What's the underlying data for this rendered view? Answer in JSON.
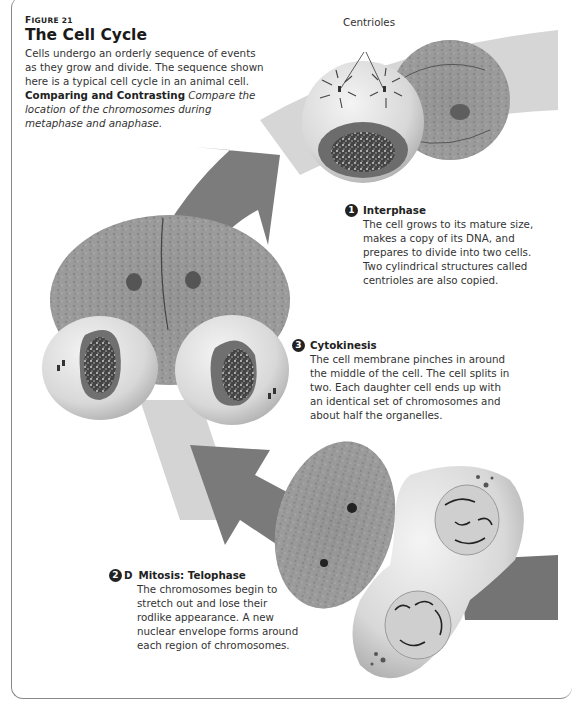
{
  "figure": {
    "number_prefix": "F",
    "number_rest": "IGURE 21",
    "title": "The Cell Cycle",
    "intro": "Cells undergo an orderly sequence of events as they grow and divide. The sequence shown here is a typical cell cycle in an animal cell.",
    "skill_label": "Comparing and Contrasting",
    "skill_prompt": "Compare the location of the chromosomes during metaphase and anaphase."
  },
  "labels": {
    "centrioles": "Centrioles"
  },
  "steps": [
    {
      "badge": "1",
      "suffix": "",
      "title": "Interphase",
      "lines": [
        "The cell grows to its mature size,",
        "makes a copy of its DNA, and",
        "prepares to divide into two cells.",
        "Two cylindrical structures called",
        "centrioles are also copied."
      ]
    },
    {
      "badge": "3",
      "suffix": "",
      "title": "Cytokinesis",
      "lines": [
        "The cell membrane pinches in around",
        "the middle of the cell. The cell splits in",
        "two. Each daughter cell ends up with",
        "an identical set of chromosomes and",
        "about half the organelles."
      ]
    },
    {
      "badge": "2",
      "suffix": "D",
      "title": "Mitosis: Telophase",
      "lines": [
        "The chromosomes begin to",
        "stretch out and lose their",
        "rodlike appearance. A new",
        "nuclear envelope forms around",
        "each region of chromosomes."
      ]
    }
  ],
  "colors": {
    "arrow_dark": "#7a7a7a",
    "arrow_light": "#d6d6d6",
    "cell_fill": "#dcdcdc",
    "nucleus": "#6a6a6a",
    "frame": "#888888"
  }
}
